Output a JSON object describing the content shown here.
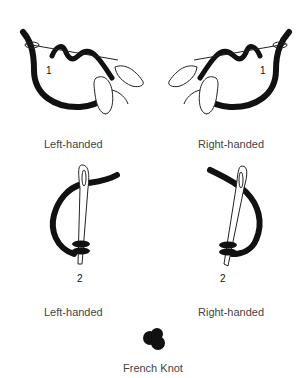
{
  "title": "French Knot",
  "steps": [
    {
      "step": "1",
      "left_label": "Left-handed",
      "right_label": "Right-handed"
    },
    {
      "step": "2",
      "left_label": "Left-handed",
      "right_label": "Right-handed"
    }
  ],
  "caption": "French Knot",
  "colors": {
    "thread": "#111111",
    "outline": "#222222",
    "text": "#444444"
  }
}
